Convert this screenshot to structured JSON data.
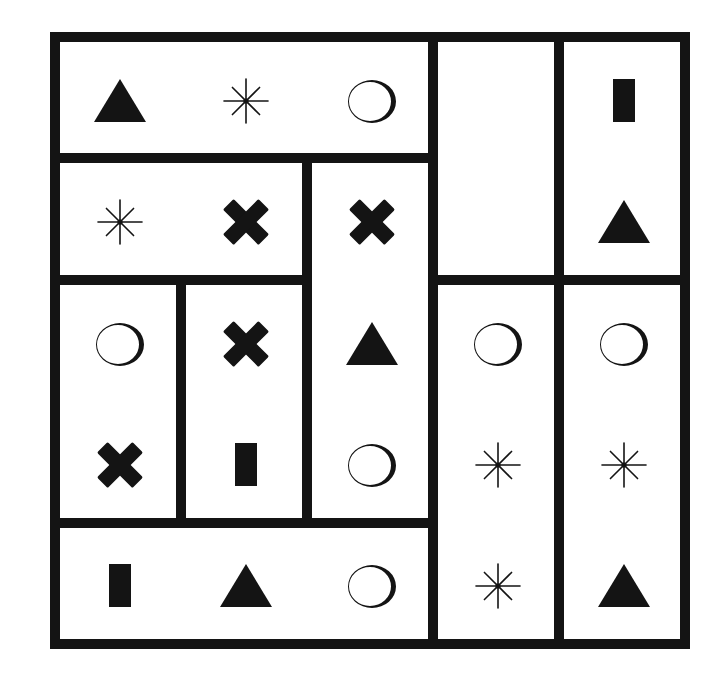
{
  "puzzle": {
    "title": "",
    "grid": {
      "rows": 5,
      "cols": 5
    },
    "colors": {
      "ink": "#141414",
      "paper": "#ffffff"
    },
    "geometry": {
      "origin_x": 50,
      "origin_y": 32,
      "cell_w": 126,
      "cell_h": 121.4,
      "border": 10
    },
    "regions": [
      {
        "id": "A",
        "row": 0,
        "col": 0,
        "rowspan": 1,
        "colspan": 3,
        "symbols": [
          {
            "r": 0,
            "c": 0,
            "shape": "triangle"
          },
          {
            "r": 0,
            "c": 1,
            "shape": "asterisk"
          },
          {
            "r": 0,
            "c": 2,
            "shape": "circle"
          }
        ]
      },
      {
        "id": "B",
        "row": 0,
        "col": 3,
        "rowspan": 2,
        "colspan": 1,
        "symbols": []
      },
      {
        "id": "C",
        "row": 0,
        "col": 4,
        "rowspan": 2,
        "colspan": 1,
        "symbols": [
          {
            "r": 0,
            "c": 4,
            "shape": "rectangle"
          },
          {
            "r": 1,
            "c": 4,
            "shape": "triangle"
          }
        ]
      },
      {
        "id": "D",
        "row": 1,
        "col": 0,
        "rowspan": 1,
        "colspan": 2,
        "symbols": [
          {
            "r": 1,
            "c": 0,
            "shape": "asterisk"
          },
          {
            "r": 1,
            "c": 1,
            "shape": "cross"
          }
        ]
      },
      {
        "id": "E",
        "row": 1,
        "col": 2,
        "rowspan": 3,
        "colspan": 1,
        "symbols": [
          {
            "r": 1,
            "c": 2,
            "shape": "cross"
          },
          {
            "r": 2,
            "c": 2,
            "shape": "triangle"
          },
          {
            "r": 3,
            "c": 2,
            "shape": "circle"
          }
        ]
      },
      {
        "id": "F",
        "row": 2,
        "col": 0,
        "rowspan": 2,
        "colspan": 1,
        "symbols": [
          {
            "r": 2,
            "c": 0,
            "shape": "circle"
          },
          {
            "r": 3,
            "c": 0,
            "shape": "cross"
          }
        ]
      },
      {
        "id": "G",
        "row": 2,
        "col": 1,
        "rowspan": 2,
        "colspan": 1,
        "symbols": [
          {
            "r": 2,
            "c": 1,
            "shape": "cross"
          },
          {
            "r": 3,
            "c": 1,
            "shape": "rectangle"
          }
        ]
      },
      {
        "id": "H",
        "row": 4,
        "col": 0,
        "rowspan": 1,
        "colspan": 3,
        "symbols": [
          {
            "r": 4,
            "c": 0,
            "shape": "rectangle"
          },
          {
            "r": 4,
            "c": 1,
            "shape": "triangle"
          },
          {
            "r": 4,
            "c": 2,
            "shape": "circle"
          }
        ]
      },
      {
        "id": "I",
        "row": 2,
        "col": 3,
        "rowspan": 3,
        "colspan": 1,
        "symbols": [
          {
            "r": 2,
            "c": 3,
            "shape": "circle"
          },
          {
            "r": 3,
            "c": 3,
            "shape": "asterisk"
          },
          {
            "r": 4,
            "c": 3,
            "shape": "asterisk"
          }
        ]
      },
      {
        "id": "J",
        "row": 2,
        "col": 4,
        "rowspan": 3,
        "colspan": 1,
        "symbols": [
          {
            "r": 2,
            "c": 4,
            "shape": "circle"
          },
          {
            "r": 3,
            "c": 4,
            "shape": "asterisk"
          },
          {
            "r": 4,
            "c": 4,
            "shape": "triangle"
          }
        ]
      }
    ],
    "shape_legend": {
      "triangle": "filled-triangle-icon",
      "asterisk": "asterisk-icon",
      "circle": "hollow-circle-icon",
      "cross": "bold-cross-icon",
      "rectangle": "filled-rectangle-icon"
    }
  }
}
